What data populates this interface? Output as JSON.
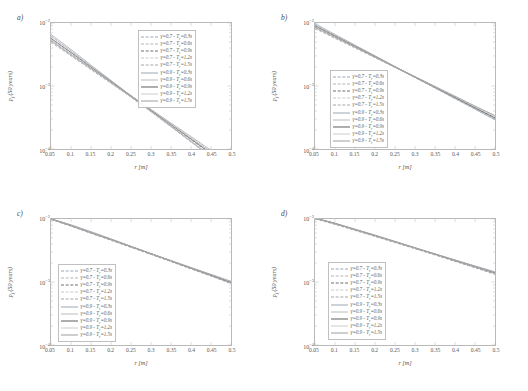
{
  "figure": {
    "panels": [
      {
        "key": "a",
        "label": "a)"
      },
      {
        "key": "b",
        "label": "b)"
      },
      {
        "key": "c",
        "label": "c)"
      },
      {
        "key": "d",
        "label": "d)"
      }
    ]
  },
  "axes": {
    "xlabel": "r [m]",
    "ylabel": "p_f (50 years)",
    "ylabel_html": "p<sub>f</sub> (50 years)",
    "xticks": [
      "0.05",
      "0.1",
      "0.15",
      "0.2",
      "0.25",
      "0.3",
      "0.35",
      "0.4",
      "0.45",
      "0.5"
    ],
    "xtick_values": [
      0.05,
      0.1,
      0.15,
      0.2,
      0.25,
      0.3,
      0.35,
      0.4,
      0.45,
      0.5
    ],
    "yticks": [
      "10-2",
      "10-3",
      "10-4"
    ],
    "ytick_values": [
      0.01,
      0.001,
      0.0001
    ],
    "xlim": [
      0.05,
      0.5
    ],
    "ylim": [
      0.0001,
      0.01
    ],
    "yscale": "log",
    "xscale": "linear",
    "grid": false
  },
  "legend": {
    "entries": [
      {
        "label": "γ=0.7 - T_r=0.3s",
        "gamma": 0.7,
        "Tr": 0.3,
        "style": "dashed",
        "color": "#9aa7b8"
      },
      {
        "label": "γ=0.7 - T_r=0.6s",
        "gamma": 0.7,
        "Tr": 0.6,
        "style": "dashed",
        "color": "#b4b4b4"
      },
      {
        "label": "γ=0.7 - T_r=0.9s",
        "gamma": 0.7,
        "Tr": 0.9,
        "style": "dashed",
        "color": "#6e6e6e"
      },
      {
        "label": "γ=0.7 - T_r=1.2s",
        "gamma": 0.7,
        "Tr": 1.2,
        "style": "dashed",
        "color": "#c9c9c9"
      },
      {
        "label": "γ=0.7 - T_r=1.5s",
        "gamma": 0.7,
        "Tr": 1.5,
        "style": "dashed",
        "color": "#a6a6a6"
      },
      {
        "label": "γ=0.9 - T_r=0.3s",
        "gamma": 0.9,
        "Tr": 0.3,
        "style": "solid",
        "color": "#9aa7b8"
      },
      {
        "label": "γ=0.9 - T_r=0.6s",
        "gamma": 0.9,
        "Tr": 0.6,
        "style": "solid",
        "color": "#bcbcbc"
      },
      {
        "label": "γ=0.9 - T_r=0.9s",
        "gamma": 0.9,
        "Tr": 0.9,
        "style": "solid",
        "color": "#5f5f5f"
      },
      {
        "label": "γ=0.9 - T_r=1.2s",
        "gamma": 0.9,
        "Tr": 1.2,
        "style": "solid",
        "color": "#cccccc"
      },
      {
        "label": "γ=0.9 - T_r=1.5s",
        "gamma": 0.9,
        "Tr": 1.5,
        "style": "solid",
        "color": "#9e9e9e"
      }
    ],
    "positions": {
      "a": {
        "left": 138,
        "top": 30
      },
      "b": {
        "left": 66,
        "top": 70
      },
      "c": {
        "left": 58,
        "top": 68
      },
      "d": {
        "left": 64,
        "top": 66
      }
    }
  },
  "chart_data": [
    {
      "type": "line",
      "title": "a)",
      "xlabel": "r [m]",
      "ylabel": "p_f (50 years)",
      "xlim": [
        0.05,
        0.5
      ],
      "ylim": [
        0.0001,
        0.01
      ],
      "yscale": "log",
      "grid": false,
      "x": [
        0.05,
        0.1,
        0.15,
        0.2,
        0.25,
        0.3,
        0.35,
        0.4,
        0.45,
        0.5
      ],
      "series": [
        {
          "name": "γ=0.7 - T_r=0.3s",
          "values": [
            0.0062,
            0.0036,
            0.00205,
            0.00118,
            0.00068,
            0.00039,
            0.000224,
            0.000129,
            7.44e-05,
            4.28e-05
          ]
        },
        {
          "name": "γ=0.7 - T_r=0.6s",
          "values": [
            0.0058,
            0.0034,
            0.00198,
            0.00115,
            0.00067,
            0.00039,
            0.000227,
            0.000132,
            7.68e-05,
            4.47e-05
          ]
        },
        {
          "name": "γ=0.7 - T_r=0.9s",
          "values": [
            0.0054,
            0.0032,
            0.0019,
            0.00113,
            0.00067,
            0.000397,
            0.000235,
            0.00014,
            8.28e-05,
            4.91e-05
          ]
        },
        {
          "name": "γ=0.7 - T_r=1.2s",
          "values": [
            0.0051,
            0.0031,
            0.00185,
            0.00111,
            0.00067,
            0.0004,
            0.00024,
            0.000144,
            8.64e-05,
            5.18e-05
          ]
        },
        {
          "name": "γ=0.7 - T_r=1.5s",
          "values": [
            0.0049,
            0.003,
            0.00181,
            0.0011,
            0.00067,
            0.000405,
            0.000246,
            0.000149,
            9.05e-05,
            5.49e-05
          ]
        },
        {
          "name": "γ=0.9 - T_r=0.3s",
          "values": [
            0.0066,
            0.0038,
            0.00215,
            0.00123,
            0.0007,
            0.000401,
            0.000229,
            0.000131,
            7.48e-05,
            4.28e-05
          ]
        },
        {
          "name": "γ=0.9 - T_r=0.6s",
          "values": [
            0.0062,
            0.0036,
            0.00208,
            0.0012,
            0.00069,
            0.000401,
            0.000232,
            0.000134,
            7.76e-05,
            4.49e-05
          ]
        },
        {
          "name": "γ=0.9 - T_r=0.9s",
          "values": [
            0.0057,
            0.0034,
            0.00199,
            0.00118,
            0.0007,
            0.000412,
            0.000244,
            0.000144,
            8.54e-05,
            5.06e-05
          ]
        },
        {
          "name": "γ=0.9 - T_r=1.2s",
          "values": [
            0.0054,
            0.0032,
            0.00194,
            0.00116,
            0.0007,
            0.000418,
            0.00025,
            0.00015,
            8.96e-05,
            5.36e-05
          ]
        },
        {
          "name": "γ=0.9 - T_r=1.5s",
          "values": [
            0.0052,
            0.0031,
            0.00189,
            0.00115,
            0.0007,
            0.000425,
            0.000258,
            0.000157,
            9.53e-05,
            5.79e-05
          ]
        }
      ]
    },
    {
      "type": "line",
      "title": "b)",
      "xlabel": "r [m]",
      "ylabel": "p_f (50 years)",
      "xlim": [
        0.05,
        0.5
      ],
      "ylim": [
        0.0001,
        0.01
      ],
      "yscale": "log",
      "grid": false,
      "x": [
        0.05,
        0.1,
        0.15,
        0.2,
        0.25,
        0.3,
        0.35,
        0.4,
        0.45,
        0.5
      ],
      "series": [
        {
          "name": "γ=0.7 - T_r=0.3s",
          "values": [
            0.0094,
            0.0064,
            0.00435,
            0.00296,
            0.00201,
            0.00137,
            0.00093,
            0.00063,
            0.00043,
            0.000292
          ]
        },
        {
          "name": "γ=0.7 - T_r=0.6s",
          "values": [
            0.009,
            0.0062,
            0.00424,
            0.00291,
            0.00199,
            0.00137,
            0.00094,
            0.00064,
            0.00044,
            0.000302
          ]
        },
        {
          "name": "γ=0.7 - T_r=0.9s",
          "values": [
            0.0086,
            0.006,
            0.00414,
            0.00286,
            0.00198,
            0.00137,
            0.00094,
            0.00065,
            0.00045,
            0.000312
          ]
        },
        {
          "name": "γ=0.7 - T_r=1.2s",
          "values": [
            0.0083,
            0.0058,
            0.00406,
            0.00283,
            0.00198,
            0.00138,
            0.00096,
            0.00067,
            0.00047,
            0.000326
          ]
        },
        {
          "name": "γ=0.7 - T_r=1.5s",
          "values": [
            0.0081,
            0.0057,
            0.004,
            0.00281,
            0.00197,
            0.00139,
            0.00097,
            0.00068,
            0.00048,
            0.000337
          ]
        },
        {
          "name": "γ=0.9 - T_r=0.3s",
          "values": [
            0.0098,
            0.0066,
            0.00447,
            0.00302,
            0.00204,
            0.00138,
            0.00093,
            0.00063,
            0.00043,
            0.00029
          ]
        },
        {
          "name": "γ=0.9 - T_r=0.6s",
          "values": [
            0.0094,
            0.0064,
            0.00437,
            0.00298,
            0.00203,
            0.00138,
            0.00094,
            0.00064,
            0.00044,
            0.0003
          ]
        },
        {
          "name": "γ=0.9 - T_r=0.9s",
          "values": [
            0.009,
            0.0062,
            0.00427,
            0.00294,
            0.00202,
            0.00139,
            0.00096,
            0.00066,
            0.00045,
            0.000312
          ]
        },
        {
          "name": "γ=0.9 - T_r=1.2s",
          "values": [
            0.0087,
            0.006,
            0.00419,
            0.00291,
            0.00202,
            0.0014,
            0.00097,
            0.00068,
            0.00047,
            0.000327
          ]
        },
        {
          "name": "γ=0.9 - T_r=1.5s",
          "values": [
            0.0085,
            0.0059,
            0.00413,
            0.00289,
            0.00202,
            0.00141,
            0.00099,
            0.00069,
            0.00048,
            0.000339
          ]
        }
      ]
    },
    {
      "type": "line",
      "title": "c)",
      "xlabel": "r [m]",
      "ylabel": "p_f (50 years)",
      "xlim": [
        0.05,
        0.5
      ],
      "ylim": [
        0.0001,
        0.01
      ],
      "yscale": "log",
      "grid": false,
      "x": [
        0.05,
        0.1,
        0.15,
        0.2,
        0.25,
        0.3,
        0.35,
        0.4,
        0.45,
        0.5
      ],
      "series": [
        {
          "name": "γ=0.7 - T_r=0.3s",
          "values": [
            0.01,
            0.008,
            0.0062,
            0.00475,
            0.00363,
            0.00277,
            0.00212,
            0.00162,
            0.00124,
            0.00094
          ]
        },
        {
          "name": "γ=0.7 - T_r=0.6s",
          "values": [
            0.01,
            0.0079,
            0.0061,
            0.0047,
            0.0036,
            0.00276,
            0.00212,
            0.00163,
            0.00125,
            0.00096
          ]
        },
        {
          "name": "γ=0.7 - T_r=0.9s",
          "values": [
            0.0099,
            0.0078,
            0.006,
            0.00464,
            0.00357,
            0.00275,
            0.00212,
            0.00163,
            0.00126,
            0.00097
          ]
        },
        {
          "name": "γ=0.7 - T_r=1.2s",
          "values": [
            0.0099,
            0.0077,
            0.006,
            0.00461,
            0.00356,
            0.00275,
            0.00213,
            0.00165,
            0.00127,
            0.00099
          ]
        },
        {
          "name": "γ=0.7 - T_r=1.5s",
          "values": [
            0.0098,
            0.0077,
            0.0059,
            0.00458,
            0.00355,
            0.00275,
            0.00214,
            0.00166,
            0.00129,
            0.001
          ]
        },
        {
          "name": "γ=0.9 - T_r=0.3s",
          "values": [
            0.0101,
            0.0081,
            0.0063,
            0.00484,
            0.0037,
            0.00283,
            0.00216,
            0.00165,
            0.00126,
            0.00096
          ]
        },
        {
          "name": "γ=0.9 - T_r=0.6s",
          "values": [
            0.0101,
            0.008,
            0.0062,
            0.00479,
            0.00367,
            0.00282,
            0.00216,
            0.00166,
            0.00127,
            0.00098
          ]
        },
        {
          "name": "γ=0.9 - T_r=0.9s",
          "values": [
            0.01,
            0.0079,
            0.0061,
            0.00474,
            0.00365,
            0.00281,
            0.00217,
            0.00167,
            0.00129,
            0.00099
          ]
        },
        {
          "name": "γ=0.9 - T_r=1.2s",
          "values": [
            0.01,
            0.0079,
            0.0061,
            0.00471,
            0.00364,
            0.00281,
            0.00218,
            0.00169,
            0.00131,
            0.00101
          ]
        },
        {
          "name": "γ=0.9 - T_r=1.5s",
          "values": [
            0.01,
            0.0078,
            0.006,
            0.00469,
            0.00363,
            0.00282,
            0.00219,
            0.0017,
            0.00132,
            0.00103
          ]
        }
      ]
    },
    {
      "type": "line",
      "title": "d)",
      "xlabel": "r [m]",
      "ylabel": "p_f (50 years)",
      "xlim": [
        0.05,
        0.5
      ],
      "ylim": [
        0.0001,
        0.01
      ],
      "yscale": "log",
      "grid": false,
      "x": [
        0.05,
        0.1,
        0.15,
        0.2,
        0.25,
        0.3,
        0.35,
        0.4,
        0.45,
        0.5
      ],
      "series": [
        {
          "name": "γ=0.7 - T_r=0.3s",
          "values": [
            0.0103,
            0.0085,
            0.0068,
            0.00545,
            0.00432,
            0.00342,
            0.0027,
            0.00213,
            0.00168,
            0.00132
          ]
        },
        {
          "name": "γ=0.7 - T_r=0.6s",
          "values": [
            0.0103,
            0.0084,
            0.0067,
            0.0054,
            0.00429,
            0.00341,
            0.0027,
            0.00214,
            0.0017,
            0.00134
          ]
        },
        {
          "name": "γ=0.7 - T_r=0.9s",
          "values": [
            0.0102,
            0.0083,
            0.0067,
            0.00535,
            0.00426,
            0.0034,
            0.00271,
            0.00215,
            0.00171,
            0.00136
          ]
        },
        {
          "name": "γ=0.7 - T_r=1.2s",
          "values": [
            0.0102,
            0.0083,
            0.0066,
            0.00531,
            0.00424,
            0.00339,
            0.00271,
            0.00216,
            0.00173,
            0.00138
          ]
        },
        {
          "name": "γ=0.7 - T_r=1.5s",
          "values": [
            0.0101,
            0.0082,
            0.0066,
            0.00528,
            0.00423,
            0.00339,
            0.00272,
            0.00217,
            0.00174,
            0.00139
          ]
        },
        {
          "name": "γ=0.9 - T_r=0.3s",
          "values": [
            0.0104,
            0.0086,
            0.0069,
            0.00556,
            0.00442,
            0.0035,
            0.00277,
            0.00219,
            0.00173,
            0.00137
          ]
        },
        {
          "name": "γ=0.9 - T_r=0.6s",
          "values": [
            0.0104,
            0.0085,
            0.0069,
            0.00551,
            0.00439,
            0.00349,
            0.00277,
            0.0022,
            0.00175,
            0.00139
          ]
        },
        {
          "name": "γ=0.9 - T_r=0.9s",
          "values": [
            0.0103,
            0.0085,
            0.0068,
            0.00547,
            0.00437,
            0.00348,
            0.00278,
            0.00221,
            0.00177,
            0.00141
          ]
        },
        {
          "name": "γ=0.9 - T_r=1.2s",
          "values": [
            0.0103,
            0.0084,
            0.0068,
            0.00544,
            0.00436,
            0.00348,
            0.00279,
            0.00223,
            0.00178,
            0.00143
          ]
        },
        {
          "name": "γ=0.9 - T_r=1.5s",
          "values": [
            0.0103,
            0.0084,
            0.0068,
            0.00542,
            0.00435,
            0.00348,
            0.0028,
            0.00224,
            0.0018,
            0.00145
          ]
        }
      ]
    }
  ]
}
